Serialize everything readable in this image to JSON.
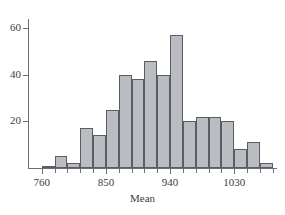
{
  "chart_data": {
    "type": "bar",
    "title": "",
    "subtitle": "",
    "xlabel": "Mean",
    "ylabel": "",
    "xlim": [
      742,
      1090
    ],
    "ylim": [
      0,
      66
    ],
    "grid": false,
    "legend": "none",
    "bin_width": 18,
    "bar_color": "#b9bcc0",
    "bar_edge_color": "#5a5d61",
    "axis_color": "#6c6f73",
    "text_color": "#3c3c3c",
    "x_tick_labels": [
      "760",
      "850",
      "940",
      "1030"
    ],
    "x_tick_values": [
      760,
      850,
      940,
      1030
    ],
    "y_tick_labels": [
      "20",
      "40",
      "60"
    ],
    "y_tick_values": [
      20,
      40,
      60
    ],
    "categories": [
      "760-778",
      "778-796",
      "796-814",
      "814-832",
      "832-850",
      "850-868",
      "868-886",
      "886-904",
      "904-922",
      "922-940",
      "940-958",
      "958-976",
      "976-994",
      "994-1012",
      "1012-1030",
      "1030-1048",
      "1048-1066",
      "1066-1084"
    ],
    "bin_starts": [
      760,
      778,
      796,
      814,
      832,
      850,
      868,
      886,
      904,
      922,
      940,
      958,
      976,
      994,
      1012,
      1030,
      1048,
      1066
    ],
    "values": [
      1,
      5,
      2,
      17,
      14,
      25,
      40,
      38,
      46,
      40,
      57,
      20,
      22,
      22,
      20,
      8,
      11,
      2
    ],
    "tail_bins": [
      {
        "start": 1048,
        "value": 2
      },
      {
        "start": 1066,
        "value": 3
      }
    ]
  },
  "axis": {
    "x_title": "Mean"
  }
}
